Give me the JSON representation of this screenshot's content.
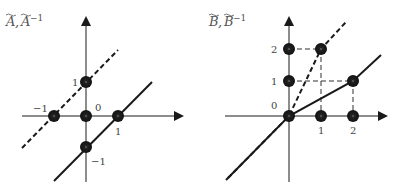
{
  "panels": [
    {
      "id": "A",
      "title": "A, A",
      "title_parts": [
        "A",
        "A"
      ],
      "title_superscript": "−1",
      "origin_label": "0",
      "tick_labels": {
        "x_pos": "1",
        "x_neg": "−1",
        "y_pos": "1",
        "y_neg": "−1"
      },
      "points": [
        [
          0,
          0
        ],
        [
          0,
          1
        ],
        [
          1,
          0
        ],
        [
          -1,
          0
        ],
        [
          0,
          -1
        ]
      ],
      "lines": [
        {
          "style": "dashed",
          "desc": "A^-1: y = x + 1",
          "from": [
            -2,
            -1
          ],
          "to": [
            1,
            2
          ]
        },
        {
          "style": "solid",
          "desc": "A: y = x - 1",
          "from": [
            -1,
            -2
          ],
          "to": [
            2,
            1
          ]
        }
      ]
    },
    {
      "id": "B",
      "title_parts": [
        "B",
        "B"
      ],
      "title_superscript": "−1",
      "origin_label": "0",
      "tick_labels": {
        "x1": "1",
        "x2": "2",
        "y1": "1",
        "y2": "2"
      },
      "points": [
        [
          0,
          0
        ],
        [
          1,
          0
        ],
        [
          2,
          0
        ],
        [
          0,
          1
        ],
        [
          0,
          2
        ],
        [
          1,
          2
        ],
        [
          2,
          1
        ]
      ],
      "lines": [
        {
          "style": "dashed",
          "desc": "B^-1: piecewise through (0,0),(1,2)"
        },
        {
          "style": "solid",
          "desc": "B: piecewise through (0,0),(2,1)"
        }
      ],
      "guides": "dashed grid lines to (1,2) and (2,1)"
    }
  ],
  "colors": {
    "ink": "#1a1a1a",
    "label": "#444444"
  }
}
